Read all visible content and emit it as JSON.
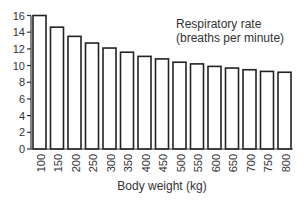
{
  "chart_data": {
    "type": "bar",
    "title": "",
    "annotation": [
      "Respiratory rate",
      "(breaths per minute)"
    ],
    "xlabel": "Body weight (kg)",
    "ylabel": "",
    "categories": [
      "100",
      "150",
      "200",
      "250",
      "300",
      "350",
      "400",
      "450",
      "500",
      "550",
      "600",
      "650",
      "700",
      "750",
      "800"
    ],
    "values": [
      16.0,
      14.6,
      13.5,
      12.7,
      12.1,
      11.6,
      11.1,
      10.8,
      10.4,
      10.2,
      9.9,
      9.7,
      9.5,
      9.3,
      9.2
    ],
    "yticks": [
      0,
      2,
      4,
      6,
      8,
      10,
      12,
      14,
      16
    ],
    "ylim": [
      0,
      16
    ],
    "grid": false,
    "legend": "none"
  },
  "colors": {
    "bar_fill": "#ffffff",
    "bar_stroke": "#222222",
    "axis": "#333333"
  }
}
